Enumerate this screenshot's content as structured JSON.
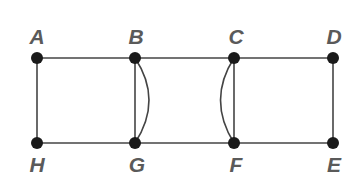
{
  "graph": {
    "nodes": [
      {
        "id": "A",
        "label": "A",
        "x": 37,
        "y": 58,
        "label_pos": "above"
      },
      {
        "id": "B",
        "label": "B",
        "x": 135,
        "y": 58,
        "label_pos": "above"
      },
      {
        "id": "C",
        "label": "C",
        "x": 234,
        "y": 58,
        "label_pos": "above"
      },
      {
        "id": "D",
        "label": "D",
        "x": 333,
        "y": 58,
        "label_pos": "above"
      },
      {
        "id": "H",
        "label": "H",
        "x": 37,
        "y": 143,
        "label_pos": "below"
      },
      {
        "id": "G",
        "label": "G",
        "x": 135,
        "y": 143,
        "label_pos": "below"
      },
      {
        "id": "F",
        "label": "F",
        "x": 234,
        "y": 143,
        "label_pos": "below"
      },
      {
        "id": "E",
        "label": "E",
        "x": 333,
        "y": 143,
        "label_pos": "below"
      }
    ],
    "edges": [
      {
        "from": "A",
        "to": "B",
        "type": "straight"
      },
      {
        "from": "B",
        "to": "C",
        "type": "straight"
      },
      {
        "from": "C",
        "to": "D",
        "type": "straight"
      },
      {
        "from": "H",
        "to": "G",
        "type": "straight"
      },
      {
        "from": "G",
        "to": "F",
        "type": "straight"
      },
      {
        "from": "F",
        "to": "E",
        "type": "straight"
      },
      {
        "from": "A",
        "to": "H",
        "type": "straight"
      },
      {
        "from": "B",
        "to": "G",
        "type": "straight"
      },
      {
        "from": "B",
        "to": "G",
        "type": "curved",
        "bulge": "right"
      },
      {
        "from": "C",
        "to": "F",
        "type": "straight"
      },
      {
        "from": "C",
        "to": "F",
        "type": "curved",
        "bulge": "left"
      },
      {
        "from": "D",
        "to": "E",
        "type": "straight"
      }
    ],
    "colors": {
      "node": "#1a1a1a",
      "edge": "#444444",
      "label": "#5a5a5a"
    }
  }
}
